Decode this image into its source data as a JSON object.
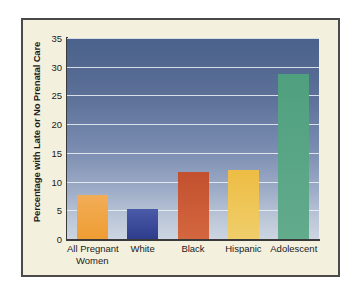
{
  "chart_data": {
    "type": "bar",
    "title": "",
    "xlabel": "",
    "ylabel": "Percentage with Late or No Prenatal Care",
    "ylim": [
      0,
      35
    ],
    "yticks": [
      0,
      5,
      10,
      15,
      20,
      25,
      30,
      35
    ],
    "ytick_labels": [
      "0",
      "5",
      "10",
      "15",
      "20",
      "25",
      "30",
      "35"
    ],
    "grid": true,
    "legend": "none",
    "categories": [
      "All Pregnant Women",
      "White",
      "Black",
      "Hispanic",
      "Adolescent"
    ],
    "category_lines": [
      [
        "All Pregnant",
        "Women"
      ],
      [
        "White"
      ],
      [
        "Black"
      ],
      [
        "Hispanic"
      ],
      [
        "Adolescent"
      ]
    ],
    "values": [
      7.7,
      5.2,
      11.7,
      12.1,
      28.7
    ],
    "bar_colors": [
      "#efa03c",
      "#3a4f9e",
      "#cd5436",
      "#ecc košy"
    ]
  },
  "colors": {
    "panel_background": "#f4f0de",
    "panel_border": "#4a4a4a",
    "plot_top": "#4a628c",
    "plot_bottom": "#ccd5e1",
    "gridline": "#eef2f7",
    "axis": "#3a3a3a",
    "text": "#1b1b1b",
    "bar_all_pregnant_women": "#f0a33f",
    "bar_white": "#37479a",
    "bar_black": "#cb5334",
    "bar_hispanic": "#eec24a",
    "bar_adolescent": "#55a583"
  },
  "bars": [
    {
      "label": "All Pregnant Women",
      "value": 7.7,
      "color_top": "#f2ad58",
      "color_bottom": "#ef9d32"
    },
    {
      "label": "White",
      "value": 5.2,
      "color_top": "#4a5aa8",
      "color_bottom": "#2e3c8c"
    },
    {
      "label": "Black",
      "value": 11.7,
      "color_top": "#c2502f",
      "color_bottom": "#d4673f"
    },
    {
      "label": "Hispanic",
      "value": 12.1,
      "color_top": "#edbd44",
      "color_bottom": "#f0ce6b"
    },
    {
      "label": "Adolescent",
      "value": 28.7,
      "color_top": "#4fa07f",
      "color_bottom": "#62ab8c"
    }
  ]
}
